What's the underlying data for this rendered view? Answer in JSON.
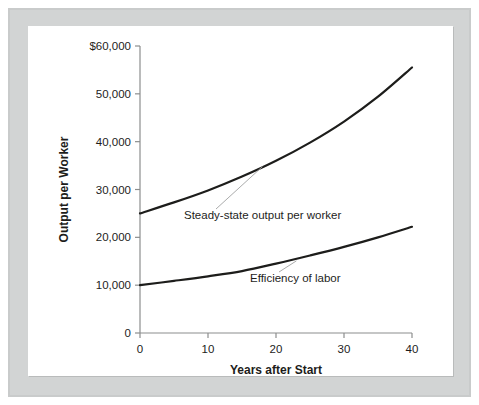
{
  "chart_data": {
    "type": "line",
    "title": "",
    "xlabel": "Years after Start",
    "ylabel": "Output per Worker",
    "xlim": [
      0,
      40
    ],
    "ylim": [
      0,
      60000
    ],
    "grid": false,
    "legend_position": "inline-annotations",
    "x_ticks": [
      "0",
      "10",
      "20",
      "30",
      "40"
    ],
    "x_tick_values": [
      0,
      10,
      20,
      30,
      40
    ],
    "y_ticks": [
      "0",
      "10,000",
      "20,000",
      "30,000",
      "40,000",
      "50,000",
      "$60,000"
    ],
    "y_tick_values": [
      0,
      10000,
      20000,
      30000,
      40000,
      50000,
      60000
    ],
    "x": [
      0,
      5,
      10,
      15,
      20,
      25,
      30,
      35,
      40
    ],
    "series": [
      {
        "name": "Steady-state output per worker",
        "values": [
          25000,
          27300,
          29800,
          32700,
          36000,
          39800,
          44200,
          49400,
          55500
        ],
        "color": "#1d1d1b"
      },
      {
        "name": "Efficiency of labor",
        "values": [
          10000,
          10900,
          11850,
          12950,
          14500,
          16200,
          18000,
          20000,
          22200
        ],
        "color": "#1d1d1b"
      }
    ],
    "annotations": [
      {
        "text": "Steady-state output per worker",
        "series": "Steady-state output per worker",
        "anchor_x": 18,
        "anchor_y": 35200
      },
      {
        "text": "Efficiency of labor",
        "series": "Efficiency of labor",
        "anchor_x": 23,
        "anchor_y": 15500
      }
    ],
    "colors": {
      "curve": "#1d1d1b",
      "axis": "#8c8e8e",
      "leader": "#a0a2a2",
      "panel_background": "#ffffff",
      "frame": "#c9cbcb"
    }
  }
}
